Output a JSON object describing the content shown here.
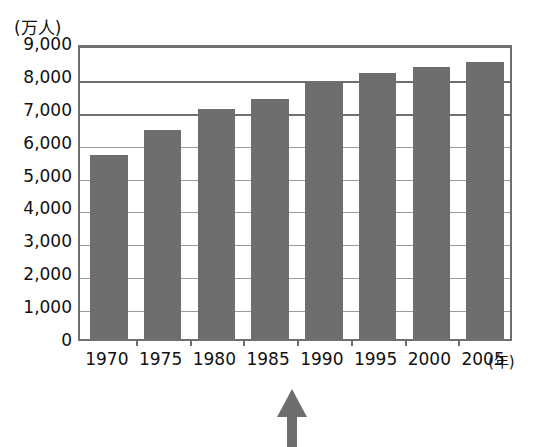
{
  "chart_data": {
    "type": "bar",
    "title": "",
    "subtitle": "",
    "xlabel": "(年)",
    "ylabel": "(万人)",
    "categories": [
      "1970",
      "1975",
      "1980",
      "1985",
      "1990",
      "1995",
      "2000",
      "2005"
    ],
    "values": [
      5600,
      6350,
      7000,
      7300,
      7800,
      8100,
      8280,
      8420
    ],
    "series": [
      {
        "name": "",
        "values": [
          5600,
          6350,
          7000,
          7300,
          7800,
          8100,
          8280,
          8420
        ]
      }
    ],
    "ylim": [
      0,
      9000
    ],
    "ytick_values": [
      9000,
      8000,
      7000,
      6000,
      5000,
      4000,
      3000,
      2000,
      1000,
      0
    ],
    "ytick_labels": [
      "9,000",
      "8,000",
      "7,000",
      "6,000",
      "5,000",
      "4,000",
      "3,000",
      "2,000",
      "1,000",
      "0"
    ],
    "grid": true,
    "legend": false,
    "legend_position": "none",
    "bar_color": "#6e6e6e",
    "axis_color": "#6f6f6f",
    "grid_color": "#8a8a8a",
    "background_color": "#ffffff",
    "annotations": [
      {
        "name": "up-arrow",
        "shape": "arrow-up",
        "color": "#6e6e6e",
        "points_at_category": "1985",
        "label": ""
      }
    ]
  }
}
